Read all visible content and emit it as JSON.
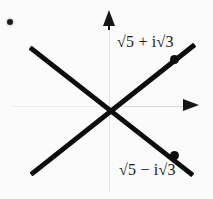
{
  "figure": {
    "width": 213,
    "height": 199,
    "background_color": "#fbfbfb",
    "ink_color": "#0d0d0d",
    "axis_color": "#e2e2e4"
  },
  "axes": {
    "vertical": {
      "name": "imaginary-axis",
      "arrow_direction": "up",
      "label": ""
    },
    "horizontal": {
      "name": "real-axis",
      "arrow_direction": "right",
      "label": ""
    },
    "origin": {
      "x": 110,
      "y": 107
    }
  },
  "rays": [
    {
      "id": "ray-up",
      "from": {
        "x": 31,
        "y": 172
      },
      "to": {
        "x": 195,
        "y": 42
      },
      "slope_sign": "positive"
    },
    {
      "id": "ray-down",
      "from": {
        "x": 30,
        "y": 45
      },
      "to": {
        "x": 193,
        "y": 173
      },
      "slope_sign": "negative"
    }
  ],
  "points": [
    {
      "id": "point-upper",
      "label": "√5 + i√3",
      "x": 174,
      "y": 59,
      "quadrant": "upper-right"
    },
    {
      "id": "point-lower",
      "label": "√5 − i√3",
      "x": 174,
      "y": 155,
      "quadrant": "lower-right"
    }
  ],
  "labels": {
    "upper": "√5 + i√3",
    "lower": "√5 − i√3"
  },
  "artifacts": {
    "corner_speck": {
      "x": 10,
      "y": 22,
      "color": "#1d1d1d"
    }
  }
}
